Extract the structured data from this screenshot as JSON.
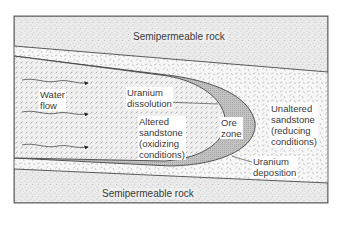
{
  "diagram": {
    "colors": {
      "semipermeable_rock": "#e9e9e9",
      "unaltered_sandstone": "#f6f6f6",
      "altered_sandstone": "#ececec",
      "ore_zone": "#bdbdbd",
      "lines": "#333333",
      "text": "#3a3a3a"
    },
    "labels": {
      "semipermeable_top": "Semipermeable rock",
      "semipermeable_bottom": "Semipermeable rock",
      "water_flow": "Water\nflow",
      "uranium_dissolution": "Uranium\ndissolution",
      "altered_sandstone": "Altered\nsandstone\n(oxidizing\nconditions)",
      "ore_zone": "Ore\nzone",
      "unaltered_sandstone": "Unaltered\nsandstone\n(reducing\nconditions)",
      "uranium_deposition": "Uranium\ndeposition"
    },
    "flow_arrows": [
      {
        "y": 83
      },
      {
        "y": 114
      },
      {
        "y": 147
      }
    ]
  }
}
